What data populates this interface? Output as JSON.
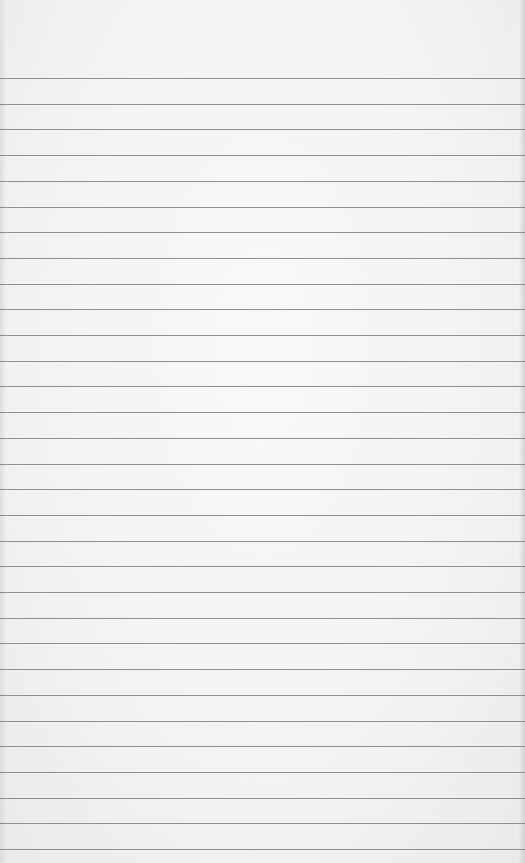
{
  "paper": {
    "type": "lined-paper",
    "background_color": "#f4f4f4",
    "line_color": "#7f7f7f",
    "first_line_y": 78,
    "line_spacing": 25.7,
    "line_count": 31
  }
}
